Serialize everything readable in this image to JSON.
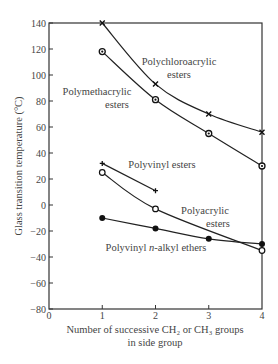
{
  "chart_data": {
    "type": "line",
    "title": "",
    "xlabel": "Number of successive CH2 or CH3 groups in side group",
    "xlabel_lines": [
      "Number of successive CH₂ or CH₃ groups",
      "in side group"
    ],
    "ylabel": "Glass transition temperature (°C)",
    "xlim": [
      0,
      4
    ],
    "ylim": [
      -80,
      140
    ],
    "xticks": [
      0,
      1,
      2,
      3,
      4
    ],
    "yticks": [
      140,
      120,
      100,
      80,
      60,
      40,
      20,
      0,
      -20,
      -40,
      -60,
      -80
    ],
    "xtick_labels": [
      "0",
      "1",
      "2",
      "3",
      "4"
    ],
    "ytick_labels": [
      "140",
      "120",
      "100",
      "80",
      "60",
      "40",
      "20",
      "0",
      "−20",
      "−40",
      "−60",
      "−80"
    ],
    "grid": false,
    "legend": "inline labels",
    "series": [
      {
        "name": "Polychloroacrylic esters",
        "label_lines": [
          "Polychloroacrylic",
          "esters"
        ],
        "marker": "x",
        "x": [
          1,
          2,
          3,
          4
        ],
        "y": [
          140,
          93,
          70,
          56
        ]
      },
      {
        "name": "Polymethacrylic esters",
        "label_lines": [
          "Polymethacrylic",
          "esters"
        ],
        "marker": "circle-dot",
        "x": [
          1,
          2,
          3,
          4
        ],
        "y": [
          118,
          81,
          55,
          30
        ]
      },
      {
        "name": "Polyvinyl esters",
        "label_lines": [
          "Polyvinyl esters"
        ],
        "marker": "plus",
        "x": [
          1,
          2
        ],
        "y": [
          32,
          11
        ]
      },
      {
        "name": "Polyacrylic esters",
        "label_lines": [
          "Polyacrylic",
          "esters"
        ],
        "marker": "open-circle",
        "x": [
          1,
          2,
          4
        ],
        "y": [
          25,
          -3,
          -35
        ]
      },
      {
        "name": "Polyvinyl n-alkyl ethers",
        "label_lines": [
          "Polyvinyl n-alkyl ethers"
        ],
        "marker": "filled-circle",
        "x": [
          1,
          2,
          3,
          4
        ],
        "y": [
          -10,
          -18,
          -26,
          -30
        ]
      }
    ]
  }
}
